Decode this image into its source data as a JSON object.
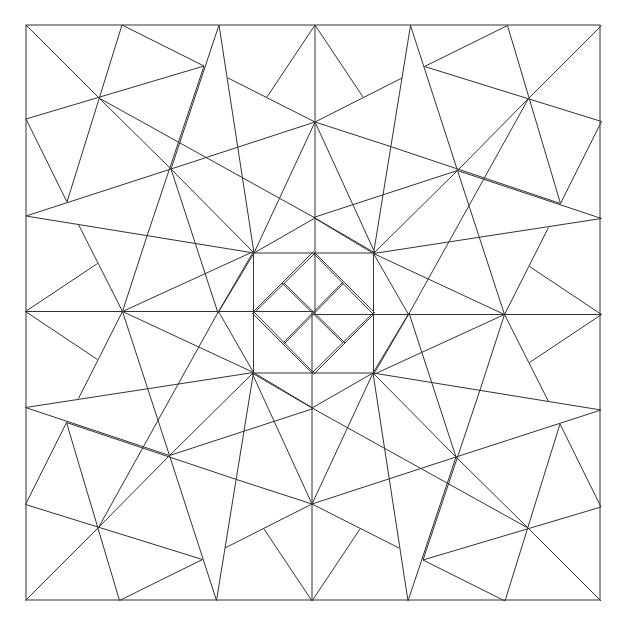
{
  "diagram": {
    "title": "",
    "stroke": "#333333",
    "background": "#ffffff",
    "center": [
      313.5,
      313
    ],
    "border": {
      "x": 26,
      "y": 25,
      "w": 574,
      "h": 575
    },
    "quadrant_lines": [
      [
        26,
        25,
        99,
        98
      ],
      [
        99,
        98,
        171,
        169
      ],
      [
        171,
        169,
        254,
        253
      ],
      [
        122,
        25,
        67,
        202
      ],
      [
        26,
        119,
        204,
        66
      ],
      [
        122,
        25,
        204,
        66
      ],
      [
        26,
        119,
        67,
        202
      ],
      [
        219,
        25,
        171,
        169
      ],
      [
        219,
        25,
        254,
        253
      ],
      [
        26,
        216,
        171,
        169
      ],
      [
        171,
        169,
        315,
        122
      ],
      [
        99,
        98,
        315,
        218
      ],
      [
        204,
        66,
        147,
        236
      ],
      [
        26,
        216,
        254,
        253
      ],
      [
        147,
        236,
        122,
        313
      ],
      [
        315,
        25,
        315,
        313
      ],
      [
        315,
        25,
        267,
        97
      ],
      [
        315,
        25,
        363,
        97
      ],
      [
        228,
        78,
        315,
        122
      ],
      [
        402,
        78,
        315,
        122
      ],
      [
        315,
        122,
        254,
        253
      ],
      [
        315,
        122,
        375,
        253
      ],
      [
        315,
        218,
        254,
        253
      ],
      [
        315,
        218,
        375,
        253
      ],
      [
        254,
        253,
        375,
        253
      ],
      [
        315,
        253,
        375,
        313
      ],
      [
        315,
        253,
        254,
        313
      ],
      [
        284,
        283,
        345,
        343
      ],
      [
        171,
        169,
        218,
        313
      ],
      [
        254,
        253,
        218,
        313
      ]
    ]
  }
}
